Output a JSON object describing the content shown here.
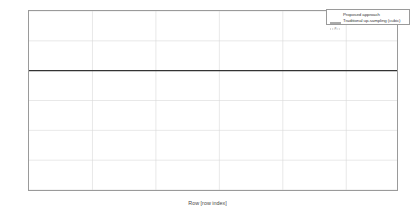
{
  "chart_data": {
    "type": "line",
    "title": "",
    "xlabel": "Row [row index]",
    "ylabel": "mse [dB]",
    "xlim": [
      0,
      290
    ],
    "ylim": [
      -40,
      20
    ],
    "xticks": [
      0,
      50,
      100,
      150,
      200,
      250
    ],
    "yticks": [
      20,
      10,
      0,
      -10,
      -20,
      -30,
      -40
    ],
    "grid": true,
    "legend_position": "top-right",
    "series": [
      {
        "name": "Proposed approach",
        "style": "solid",
        "color": "#444444",
        "description": "Piecewise-constant plateaus stepping downward, then dense oscillation after row 215",
        "plateaus": [
          {
            "x0": 2,
            "x1": 14,
            "y": 13.5
          },
          {
            "x0": 18,
            "x1": 30,
            "y": 16.8
          },
          {
            "x0": 31,
            "x1": 43,
            "y": 5.3
          },
          {
            "x0": 48,
            "x1": 61,
            "y": 11.8
          },
          {
            "x0": 63,
            "x1": 75,
            "y": -1.5
          },
          {
            "x0": 80,
            "x1": 93,
            "y": 9.0
          },
          {
            "x0": 98,
            "x1": 111,
            "y": -8.9
          },
          {
            "x0": 113,
            "x1": 126,
            "y": 7.3
          },
          {
            "x0": 131,
            "x1": 143,
            "y": -23.2
          },
          {
            "x0": 145,
            "x1": 158,
            "y": 6.5
          },
          {
            "x0": 162,
            "x1": 175,
            "y": -17.8
          },
          {
            "x0": 177,
            "x1": 189,
            "y": 5.6
          },
          {
            "x0": 193,
            "x1": 206,
            "y": -11.3
          },
          {
            "x0": 208,
            "x1": 220,
            "y": 4.6
          }
        ],
        "oscillation": {
          "x_start": 221,
          "x_end": 288,
          "peak_high": 10.6,
          "peak_low": -32.0,
          "note": "High frequency ringing with deep downward spikes near rows 226, 238, 257, 270"
        }
      },
      {
        "name": "Traditional up-sampling (cubic)",
        "style": "dotted-with-markers",
        "color": "#8a8a8a",
        "marker": "*",
        "description": "Dotted vertical excursions connecting plateau transitions, spanning roughly +20 to -30 dB",
        "markers_y_range": [
          -30,
          20
        ]
      }
    ]
  },
  "legend": {
    "items": [
      {
        "label": "Proposed approach",
        "sample": "line"
      },
      {
        "label": "Traditional up-sampling (cubic)",
        "sample": "dotted-marker"
      }
    ]
  },
  "axis": {
    "ylabel": "mse [dB]",
    "xlabel": "Row [row index]",
    "ytick_labels": [
      "20",
      "10",
      "0",
      "-10",
      "-20",
      "-30",
      "-40"
    ],
    "xtick_labels": [
      "0",
      "50",
      "100",
      "150",
      "200",
      "250"
    ]
  },
  "colors": {
    "frame": "#9a9a9a",
    "grid": "#d8d8d8",
    "zero_line": "#333333",
    "series_main": "#444444",
    "series_ref": "#8a8a8a",
    "background": "#ffffff"
  }
}
